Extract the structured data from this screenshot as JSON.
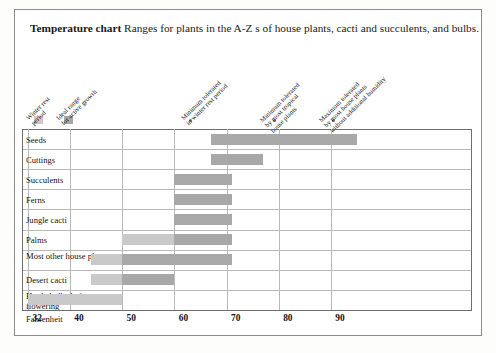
{
  "title": {
    "strong": "Temperature chart",
    "rest": " Ranges for plants in the A-Z s of house plants, cacti and succulents, and bulbs."
  },
  "colors": {
    "winter_rest": "#c9c9c9",
    "ideal_range": "#a8a8a8",
    "marker_dot": "#6f6f6f",
    "grid": "#b9b9b9",
    "border": "#6e6e6e",
    "frame": "#8d8d8d"
  },
  "legend": {
    "items": [
      {
        "type": "swatch",
        "color_key": "winter_rest",
        "lines": [
          "Winter rest",
          "period"
        ],
        "x": 34
      },
      {
        "type": "swatch",
        "color_key": "ideal_range",
        "lines": [
          "Ideal range",
          "for active growth"
        ],
        "x": 64
      },
      {
        "type": "dot",
        "lines": [
          "Minimum tolerated",
          "in winter rest period"
        ],
        "value": 40,
        "x": 190
      },
      {
        "type": "dot",
        "lines": [
          "Minimum tolerated",
          "by most tropical",
          "house plants"
        ],
        "value": 50,
        "x": 274
      },
      {
        "type": "dot",
        "lines": [
          "Maximum tolerated",
          "by most house plants",
          "without additional humidity"
        ],
        "value": 60,
        "x": 333
      }
    ]
  },
  "axis": {
    "name": "Fahrenheit",
    "ticks": [
      32,
      40,
      50,
      60,
      70,
      80,
      90
    ],
    "min": 30.8,
    "max": 117
  },
  "chart_data": {
    "type": "bar",
    "title": "Temperature chart",
    "xlabel": "Fahrenheit",
    "ylabel": "",
    "xlim": [
      30.8,
      117
    ],
    "grid": true,
    "legend_position": "top",
    "categories": [
      "Seeds",
      "Cuttings",
      "Succulents",
      "Ferns",
      "Jungle cacti",
      "Palms",
      "Most other house plants",
      "Desert cacti",
      "Hardy bulbs before flowering"
    ],
    "series": [
      {
        "name": "Winter rest period",
        "color": "#c9c9c9",
        "ranges": [
          null,
          null,
          null,
          null,
          null,
          [
            50,
            60
          ],
          [
            44,
            50
          ],
          [
            44,
            50
          ],
          [
            32,
            50
          ]
        ]
      },
      {
        "name": "Ideal range for active growth",
        "color": "#a8a8a8",
        "ranges": [
          [
            67,
            95
          ],
          [
            67,
            77
          ],
          [
            60,
            71
          ],
          [
            60,
            71
          ],
          [
            60,
            71
          ],
          [
            60,
            71
          ],
          [
            50,
            71
          ],
          [
            50,
            60
          ],
          null
        ]
      }
    ],
    "markers": [
      {
        "label": "Minimum tolerated in winter rest period",
        "value": 40
      },
      {
        "label": "Minimum tolerated by most tropical house plants",
        "value": 50
      },
      {
        "label": "Maximum tolerated by most house plants without additional humidity",
        "value": 60
      }
    ]
  }
}
